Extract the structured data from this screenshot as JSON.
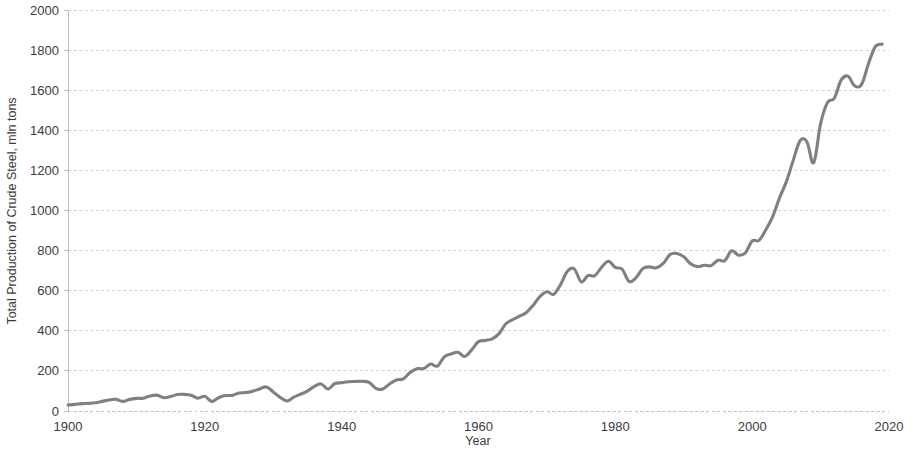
{
  "chart_data": {
    "type": "line",
    "title": "",
    "xlabel": "Year",
    "ylabel": "Total Production of Crude Steel, mln tons",
    "xlim": [
      1900,
      2020
    ],
    "ylim": [
      0,
      2000
    ],
    "x_ticks": [
      1900,
      1920,
      1940,
      1960,
      1980,
      2000,
      2020
    ],
    "y_ticks": [
      0,
      200,
      400,
      600,
      800,
      1000,
      1200,
      1400,
      1600,
      1800,
      2000
    ],
    "grid": true,
    "legend": "none",
    "series_color": "#808084",
    "series": [
      {
        "name": "Total Production of Crude Steel",
        "x": [
          1900,
          1901,
          1902,
          1903,
          1904,
          1905,
          1906,
          1907,
          1908,
          1909,
          1910,
          1911,
          1912,
          1913,
          1914,
          1915,
          1916,
          1917,
          1918,
          1919,
          1920,
          1921,
          1922,
          1923,
          1924,
          1925,
          1926,
          1927,
          1928,
          1929,
          1930,
          1931,
          1932,
          1933,
          1934,
          1935,
          1936,
          1937,
          1938,
          1939,
          1940,
          1941,
          1942,
          1943,
          1944,
          1945,
          1946,
          1947,
          1948,
          1949,
          1950,
          1951,
          1952,
          1953,
          1954,
          1955,
          1956,
          1957,
          1958,
          1959,
          1960,
          1961,
          1962,
          1963,
          1964,
          1965,
          1966,
          1967,
          1968,
          1969,
          1970,
          1971,
          1972,
          1973,
          1974,
          1975,
          1976,
          1977,
          1978,
          1979,
          1980,
          1981,
          1982,
          1983,
          1984,
          1985,
          1986,
          1987,
          1988,
          1989,
          1990,
          1991,
          1992,
          1993,
          1994,
          1995,
          1996,
          1997,
          1998,
          1999,
          2000,
          2001,
          2002,
          2003,
          2004,
          2005,
          2006,
          2007,
          2008,
          2009,
          2010,
          2011,
          2012,
          2013,
          2014,
          2015,
          2016,
          2017,
          2018,
          2019
        ],
        "values": [
          30,
          33,
          37,
          38,
          41,
          48,
          55,
          58,
          48,
          58,
          63,
          64,
          75,
          79,
          66,
          72,
          82,
          83,
          78,
          64,
          73,
          48,
          66,
          77,
          78,
          90,
          92,
          99,
          110,
          120,
          95,
          68,
          50,
          69,
          84,
          99,
          123,
          135,
          110,
          137,
          141,
          146,
          147,
          148,
          143,
          113,
          110,
          135,
          155,
          160,
          192,
          211,
          212,
          234,
          224,
          270,
          284,
          293,
          272,
          305,
          346,
          352,
          360,
          386,
          435,
          456,
          473,
          491,
          528,
          572,
          595,
          582,
          631,
          697,
          709,
          644,
          675,
          675,
          717,
          747,
          716,
          707,
          646,
          664,
          710,
          719,
          714,
          736,
          780,
          786,
          770,
          734,
          720,
          727,
          725,
          752,
          750,
          799,
          777,
          789,
          848,
          851,
          904,
          970,
          1063,
          1144,
          1250,
          1348,
          1343,
          1239,
          1433,
          1538,
          1560,
          1650,
          1670,
          1621,
          1629,
          1732,
          1817,
          1830
        ]
      }
    ]
  },
  "axes": {
    "y_label": "Total Production of Crude Steel, mln tons",
    "x_label": "Year"
  }
}
